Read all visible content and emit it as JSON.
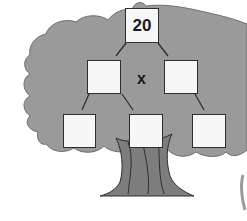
{
  "diagram": {
    "type": "factor-tree",
    "root": {
      "value": "20",
      "label": "20"
    },
    "operator": "x",
    "level2": [
      {
        "id": "left",
        "value": ""
      },
      {
        "id": "right",
        "value": ""
      }
    ],
    "level3": [
      {
        "id": "left",
        "value": ""
      },
      {
        "id": "middle",
        "value": ""
      },
      {
        "id": "right",
        "value": ""
      }
    ],
    "colors": {
      "foliage": "#9a9a9a",
      "trunk": "#7d7d7d",
      "outline": "#2e2e2e",
      "box_fill": "#f7f7f7",
      "background": "#ffffff"
    }
  }
}
